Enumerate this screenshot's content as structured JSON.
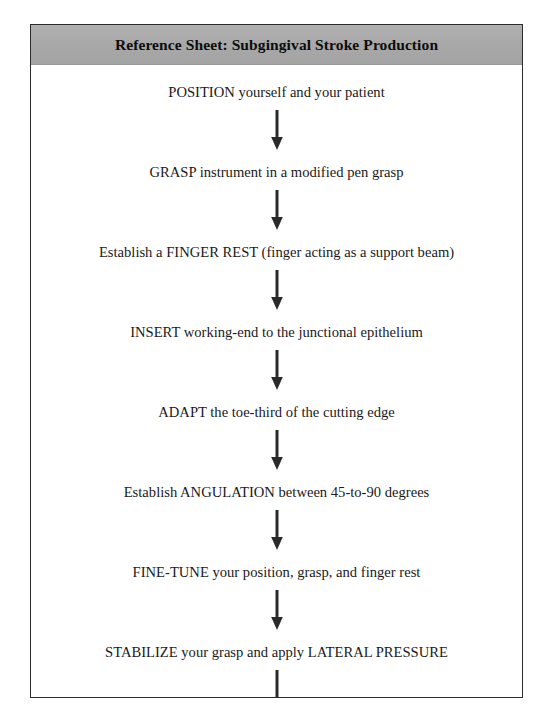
{
  "document": {
    "title": "Reference Sheet: Subgingival Stroke Production",
    "colors": {
      "title_band": "#a9a9a9",
      "border": "#2b2b2b",
      "text": "#1a1a1a",
      "arrow": "#2a2a2a",
      "page_background": "#ffffff"
    }
  },
  "flow": {
    "arrow_icon": "down-arrow-icon",
    "steps": [
      {
        "label": "POSITION yourself and your patient"
      },
      {
        "label": "GRASP instrument in a modified pen grasp"
      },
      {
        "label": "Establish a FINGER REST (finger acting as a support beam)"
      },
      {
        "label": "INSERT working-end to the junctional epithelium"
      },
      {
        "label": "ADAPT the toe-third of the cutting edge"
      },
      {
        "label": "Establish ANGULATION between 45-to-90 degrees"
      },
      {
        "label": "FINE-TUNE your position, grasp, and finger rest"
      },
      {
        "label": "STABILIZE your grasp and apply LATERAL PRESSURE"
      },
      {
        "label": "ACTIVATE a pull stroke away from the junctional epithelium"
      },
      {
        "label": "At end of stroke, PAUSE BRIEFLY and RELAX muscles"
      }
    ]
  }
}
